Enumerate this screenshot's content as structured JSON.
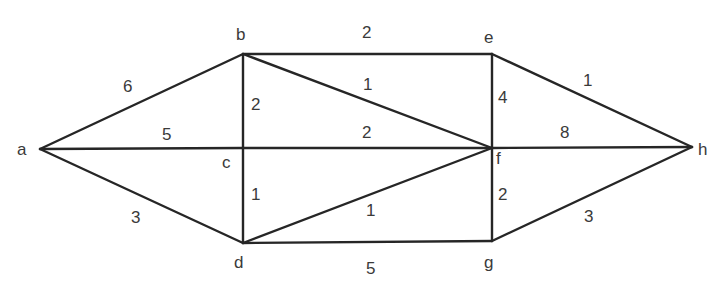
{
  "graph": {
    "nodes": [
      {
        "id": "a",
        "label": "a"
      },
      {
        "id": "b",
        "label": "b"
      },
      {
        "id": "c",
        "label": "c"
      },
      {
        "id": "d",
        "label": "d"
      },
      {
        "id": "e",
        "label": "e"
      },
      {
        "id": "f",
        "label": "f"
      },
      {
        "id": "g",
        "label": "g"
      },
      {
        "id": "h",
        "label": "h"
      }
    ],
    "edges": [
      {
        "from": "a",
        "to": "b",
        "weight": "6"
      },
      {
        "from": "a",
        "to": "c",
        "weight": "5"
      },
      {
        "from": "a",
        "to": "d",
        "weight": "3"
      },
      {
        "from": "b",
        "to": "c",
        "weight": "2"
      },
      {
        "from": "b",
        "to": "e",
        "weight": "2"
      },
      {
        "from": "b",
        "to": "f",
        "weight": "1"
      },
      {
        "from": "c",
        "to": "d",
        "weight": "1"
      },
      {
        "from": "c",
        "to": "f",
        "weight": "2"
      },
      {
        "from": "d",
        "to": "f",
        "weight": "1"
      },
      {
        "from": "d",
        "to": "g",
        "weight": "5"
      },
      {
        "from": "e",
        "to": "f",
        "weight": "4"
      },
      {
        "from": "e",
        "to": "h",
        "weight": "1"
      },
      {
        "from": "f",
        "to": "h",
        "weight": "8"
      },
      {
        "from": "f",
        "to": "g",
        "weight": "2"
      },
      {
        "from": "g",
        "to": "h",
        "weight": "3"
      }
    ]
  }
}
